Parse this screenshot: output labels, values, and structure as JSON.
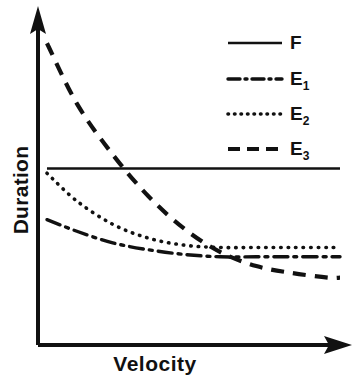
{
  "chart_data": {
    "type": "line",
    "title": "",
    "xlabel": "Velocity",
    "ylabel": "Duration",
    "xlim": [
      0,
      100
    ],
    "ylim": [
      0,
      100
    ],
    "grid": false,
    "axis_ticks": false,
    "legend_position": "top-right",
    "series": [
      {
        "name": "F",
        "label": "F",
        "style": "solid",
        "color": "#111111",
        "x": [
          2,
          12,
          24,
          36,
          48,
          60,
          72,
          84,
          96,
          100
        ],
        "values": [
          76,
          76,
          76,
          76,
          76,
          76,
          76,
          76,
          76,
          76
        ]
      },
      {
        "name": "E1",
        "label": "E",
        "sublabel": "1",
        "style": "dash-dot",
        "color": "#111111",
        "x": [
          2,
          12,
          24,
          36,
          48,
          60,
          72,
          84,
          96,
          100
        ],
        "values": [
          54,
          49,
          44,
          41,
          39,
          38,
          38,
          38,
          38,
          38
        ]
      },
      {
        "name": "E2",
        "label": "E",
        "sublabel": "2",
        "style": "dotted",
        "color": "#111111",
        "x": [
          2,
          12,
          24,
          36,
          48,
          60,
          72,
          84,
          96,
          100
        ],
        "values": [
          74,
          62,
          52,
          46,
          43,
          42,
          42,
          42,
          42,
          42
        ]
      },
      {
        "name": "E3",
        "label": "E",
        "sublabel": "3",
        "style": "dashed",
        "color": "#111111",
        "x": [
          2,
          12,
          24,
          36,
          48,
          60,
          72,
          84,
          96,
          100
        ],
        "values": [
          130,
          104,
          82,
          64,
          50,
          40,
          34,
          31,
          29,
          29
        ]
      }
    ],
    "legend": [
      {
        "label": "F",
        "sub": "",
        "style": "solid"
      },
      {
        "label": "E",
        "sub": "1",
        "style": "dash-dot"
      },
      {
        "label": "E",
        "sub": "2",
        "style": "dotted"
      },
      {
        "label": "E",
        "sub": "3",
        "style": "dashed"
      }
    ]
  }
}
